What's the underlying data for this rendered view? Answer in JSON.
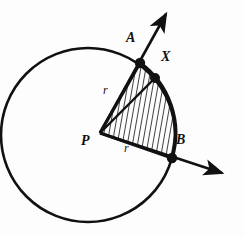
{
  "figure": {
    "background_color": "#fdfdfd",
    "stroke_color": "#111111",
    "hatch_color": "#111111",
    "width": 244,
    "height": 236
  },
  "circle": {
    "name": "main-circle",
    "center": {
      "x": 88,
      "y": 135
    },
    "radius": 87,
    "stroke_width": 2.6
  },
  "points": [
    {
      "id": "P",
      "label": "P",
      "x": 100,
      "y": 133,
      "dot": false,
      "label_x": 82,
      "label_y": 141
    },
    {
      "id": "A",
      "label": "A",
      "x": 140,
      "y": 63,
      "dot": true,
      "label_x": 126,
      "label_y": 38
    },
    {
      "id": "X",
      "label": "X",
      "x": 155,
      "y": 78,
      "dot": true,
      "label_x": 161,
      "label_y": 57
    },
    {
      "id": "B",
      "label": "B",
      "x": 172,
      "y": 158,
      "dot": true,
      "label_x": 176,
      "label_y": 140
    }
  ],
  "segments": [
    {
      "id": "PA",
      "label": "r",
      "from": "P",
      "to": "A",
      "label_x": 103,
      "label_y": 90
    },
    {
      "id": "PB",
      "label": "r",
      "from": "P",
      "to": "B",
      "label_x": 124,
      "label_y": 148
    },
    {
      "id": "PX",
      "label": "",
      "from": "P",
      "to": "X",
      "label_x": 0,
      "label_y": 0
    }
  ],
  "rays": [
    {
      "id": "ray-PA",
      "through": "A",
      "tip_x": 168,
      "tip_y": 10,
      "arrowhead": true
    },
    {
      "id": "ray-PB",
      "through": "B",
      "tip_x": 228,
      "tip_y": 176,
      "arrowhead": true
    }
  ],
  "shaded_region": {
    "name": "sector-PAB",
    "fill": "hatched",
    "hatch_angle_deg": 80,
    "hatch_spacing_px": 5
  },
  "arc": {
    "name": "arc-AB",
    "from": "A",
    "to": "B",
    "stroke_width": 3.4
  }
}
